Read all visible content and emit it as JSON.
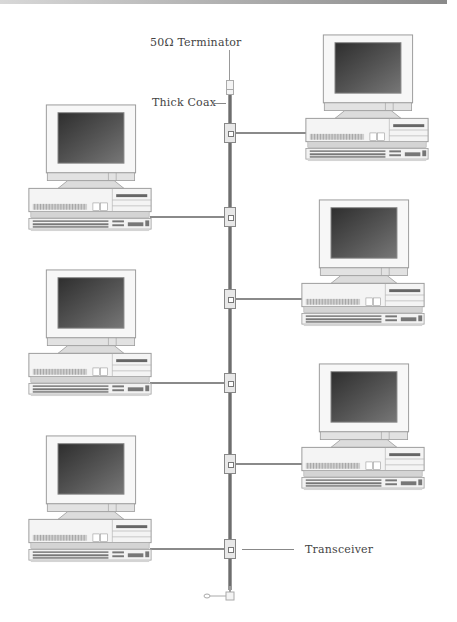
{
  "labels": {
    "terminator": "50Ω Terminator",
    "thick_coax": "Thick Coax",
    "transceiver": "Transceiver"
  },
  "colors": {
    "cable": "#6e6e6e",
    "screen": "#4a4a4a",
    "case": "#f2f2f2",
    "outline": "#9a9a9a"
  },
  "nodes": [
    {
      "id": "pc-1",
      "side": "right",
      "tap_y": 133
    },
    {
      "id": "pc-2",
      "side": "left",
      "tap_y": 217
    },
    {
      "id": "pc-3",
      "side": "right",
      "tap_y": 299
    },
    {
      "id": "pc-4",
      "side": "left",
      "tap_y": 383
    },
    {
      "id": "pc-5",
      "side": "right",
      "tap_y": 464
    },
    {
      "id": "pc-6",
      "side": "left",
      "tap_y": 549
    }
  ]
}
